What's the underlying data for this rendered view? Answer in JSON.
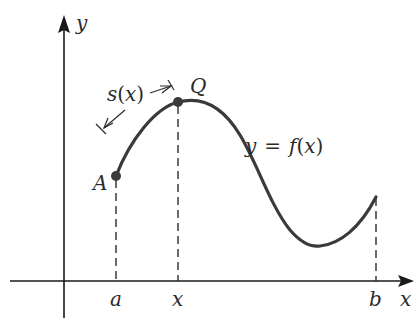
{
  "diagram": {
    "type": "arc-length-function",
    "axes": {
      "x_label": "x",
      "y_label": "y"
    },
    "x_ticks": [
      {
        "label": "a",
        "x": 116
      },
      {
        "label": "x",
        "x": 178
      },
      {
        "label": "b",
        "x": 376
      }
    ],
    "points": [
      {
        "label": "A",
        "x": 116,
        "y": 176,
        "color": "#3a3a3a"
      },
      {
        "label": "Q",
        "x": 178,
        "y": 102,
        "color": "#3a3a3a"
      }
    ],
    "arc_label": {
      "s": "s",
      "open": "(",
      "var": "x",
      "close": ")"
    },
    "curve_label": {
      "lhs": "y",
      "eq": "=",
      "f": "f",
      "open": "(",
      "var": "x",
      "close": ")"
    },
    "colors": {
      "curve": "#3a3a3a",
      "axis": "#1a1a1a",
      "text": "#2b2b2b",
      "dash": "#2b2b2b"
    }
  }
}
